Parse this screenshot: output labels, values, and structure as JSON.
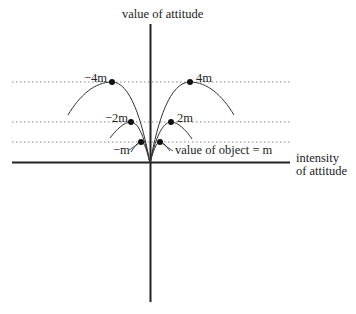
{
  "diagram": {
    "y_axis_label": "value of attitude",
    "x_axis_label_line1": "intensity",
    "x_axis_label_line2": "of attitude",
    "levels": [
      {
        "left": "−4m",
        "right": "4m"
      },
      {
        "left": "−2m",
        "right": "2m"
      },
      {
        "left": "−m",
        "right": "value of object = m"
      }
    ]
  },
  "colors": {
    "ink": "#222222",
    "dotted": "#888888",
    "background": "#ffffff"
  }
}
